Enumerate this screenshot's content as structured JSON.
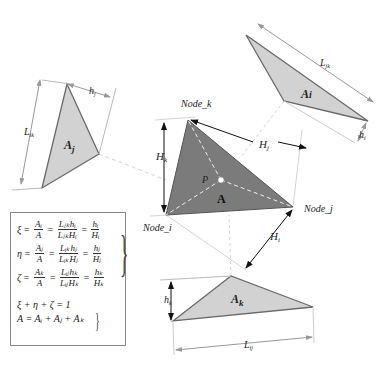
{
  "diagram": {
    "main_triangle": {
      "label": "A",
      "point_label": "P",
      "nodes": {
        "i": "Node_i",
        "j": "Node_j",
        "k": "Node_k"
      },
      "heights": {
        "i": "H",
        "i_sub": "i",
        "j": "H",
        "j_sub": "j",
        "k": "H",
        "k_sub": "k"
      }
    },
    "sub_triangles": {
      "i": {
        "label": "A",
        "sub": "i",
        "base": "L",
        "base_sub": "jk",
        "height": "h",
        "height_sub": "i"
      },
      "j": {
        "label": "A",
        "sub": "j",
        "base": "L",
        "base_sub": "ik",
        "height": "h",
        "height_sub": "j"
      },
      "k": {
        "label": "A",
        "sub": "k",
        "base": "L",
        "base_sub": "ij",
        "height": "h",
        "height_sub": "k"
      }
    },
    "colors": {
      "main_fill": "#7a7a7a",
      "sub_fill": "#d0d0d0",
      "edge": "#666666",
      "guide": "#cccccc",
      "arrow": "#111111"
    }
  },
  "formulas": {
    "xi": {
      "lhs": "ξ",
      "f1_num": "Aᵢ",
      "f1_den": "A",
      "f2_num": "Lⱼₖhᵢ",
      "f2_den": "LⱼₖHᵢ",
      "f3_num": "hᵢ",
      "f3_den": "Hᵢ"
    },
    "eta": {
      "lhs": "η",
      "f1_num": "Aⱼ",
      "f1_den": "A",
      "f2_num": "Lᵢₖhⱼ",
      "f2_den": "LᵢₖHⱼ",
      "f3_num": "hⱼ",
      "f3_den": "Hⱼ"
    },
    "zeta": {
      "lhs": "ζ",
      "f1_num": "Aₖ",
      "f1_den": "A",
      "f2_num": "Lᵢⱼhₖ",
      "f2_den": "LᵢⱼHₖ",
      "f3_num": "hₖ",
      "f3_den": "Hₖ"
    },
    "sum": "ξ + η + ζ = 1",
    "area": "A = Aᵢ + Aⱼ + Aₖ",
    "eq": "="
  }
}
